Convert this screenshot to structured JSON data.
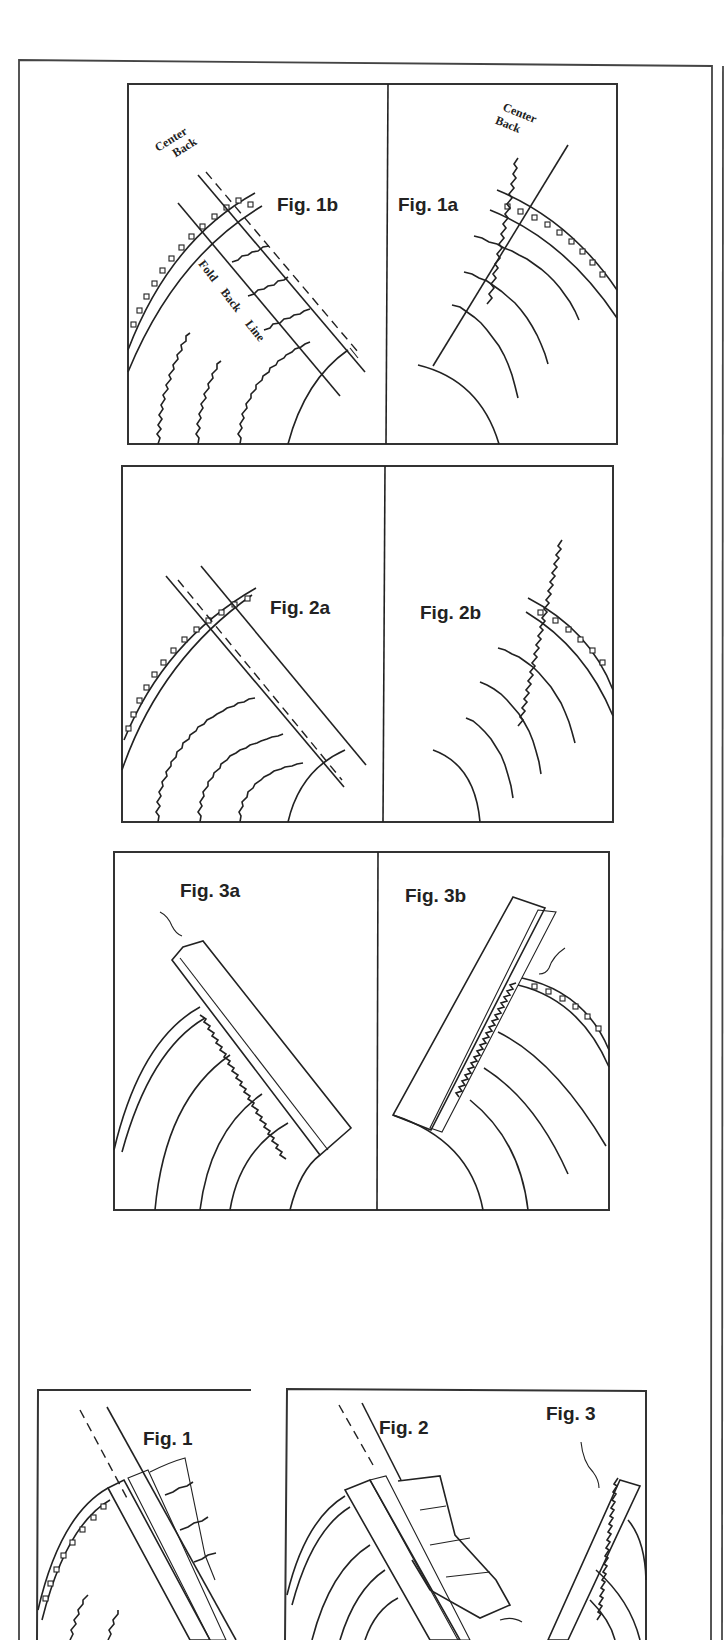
{
  "page": {
    "type": "scanned instructional illustration page",
    "background": "#ffffff",
    "ink_color": "#222222"
  },
  "panels": [
    {
      "id": "fig-1b",
      "label": "Fig. 1b",
      "annotations": [
        "Center",
        "Back",
        "Fold Back Line"
      ]
    },
    {
      "id": "fig-1a",
      "label": "Fig. 1a",
      "annotations": [
        "Center",
        "Back"
      ]
    },
    {
      "id": "fig-2a",
      "label": "Fig. 2a",
      "annotations": []
    },
    {
      "id": "fig-2b",
      "label": "Fig. 2b",
      "annotations": []
    },
    {
      "id": "fig-3a",
      "label": "Fig. 3a",
      "annotations": []
    },
    {
      "id": "fig-3b",
      "label": "Fig. 3b",
      "annotations": []
    },
    {
      "id": "fig-1",
      "label": "Fig. 1",
      "annotations": []
    },
    {
      "id": "fig-2",
      "label": "Fig. 2",
      "annotations": []
    },
    {
      "id": "fig-3",
      "label": "Fig. 3",
      "annotations": []
    }
  ],
  "labels": {
    "center": "Center",
    "back": "Back",
    "fold": "Fold",
    "back2": "Back",
    "line": "Line"
  }
}
